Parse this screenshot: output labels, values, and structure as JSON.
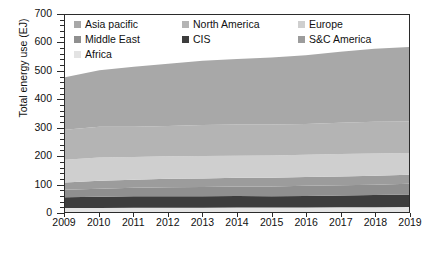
{
  "chart_data": {
    "type": "area",
    "stacked": true,
    "title": "",
    "xlabel": "",
    "ylabel": "Total energy use (EJ)",
    "x": [
      2009,
      2010,
      2011,
      2012,
      2013,
      2014,
      2015,
      2016,
      2017,
      2018,
      2019
    ],
    "xtick_labels": [
      "2009",
      "2010",
      "2011",
      "2012",
      "2013",
      "2014",
      "2015",
      "2016",
      "2017",
      "2018",
      "2019"
    ],
    "ytick_labels": [
      "0",
      "100",
      "200",
      "300",
      "400",
      "500",
      "600",
      "700"
    ],
    "ylim": [
      0,
      700
    ],
    "ytick_step": 100,
    "yminor_step": 20,
    "grid": false,
    "legend_position": "top-left-inside",
    "stack_order_bottom_to_top": [
      "Africa",
      "CIS",
      "Middle East",
      "S&C America",
      "Europe",
      "North America",
      "Asia pacific"
    ],
    "series": [
      {
        "name": "Asia pacific",
        "color": "#a8a8a8",
        "values": [
          187,
          201,
          213,
          221,
          228,
          233,
          238,
          244,
          252,
          259,
          264
        ]
      },
      {
        "name": "North America",
        "color": "#b4b4b4",
        "values": [
          106,
          109,
          108,
          108,
          110,
          111,
          110,
          110,
          111,
          113,
          112
        ]
      },
      {
        "name": "Europe",
        "color": "#cfcfcf",
        "values": [
          81,
          83,
          80,
          80,
          80,
          78,
          79,
          79,
          80,
          79,
          78
        ]
      },
      {
        "name": "Middle East",
        "color": "#8f8f8f",
        "values": [
          27,
          29,
          30,
          32,
          33,
          34,
          35,
          36,
          36,
          37,
          38
        ]
      },
      {
        "name": "CIS",
        "color": "#3d3d3d",
        "values": [
          38,
          40,
          41,
          41,
          41,
          41,
          40,
          41,
          42,
          43,
          44
        ]
      },
      {
        "name": "S&C America",
        "color": "#9c9c9c",
        "values": [
          26,
          28,
          29,
          30,
          30,
          31,
          31,
          31,
          31,
          32,
          32
        ]
      },
      {
        "name": "Africa",
        "color": "#e3e3e3",
        "values": [
          14,
          14,
          15,
          15,
          15,
          16,
          16,
          16,
          17,
          17,
          18
        ]
      }
    ],
    "totals": [
      479,
      504,
      516,
      527,
      537,
      544,
      549,
      557,
      569,
      580,
      586
    ],
    "legend_entries": [
      {
        "label": "Asia pacific",
        "color": "#a8a8a8"
      },
      {
        "label": "North America",
        "color": "#b4b4b4"
      },
      {
        "label": "Europe",
        "color": "#cfcfcf"
      },
      {
        "label": "Middle East",
        "color": "#8f8f8f"
      },
      {
        "label": "CIS",
        "color": "#3d3d3d"
      },
      {
        "label": "S&C America",
        "color": "#9c9c9c"
      },
      {
        "label": "Africa",
        "color": "#e3e3e3"
      }
    ],
    "axis_color": "#2b2b2b",
    "background": "#ffffff"
  }
}
